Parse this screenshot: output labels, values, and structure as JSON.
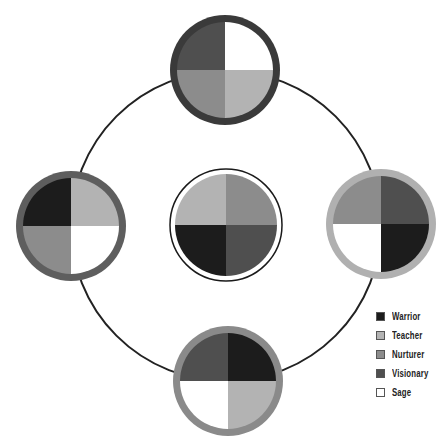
{
  "colors": {
    "Warrior": "#1c1c1c",
    "Teacher": "#b3b3b3",
    "Nurturer": "#8c8c8c",
    "Visionary": "#4f4f4f",
    "Sage": "#ffffff"
  },
  "orbit": {
    "cx": 226,
    "cy": 226,
    "r": 155,
    "stroke": "#222222"
  },
  "nodes": [
    {
      "name": "top",
      "cx": 225,
      "cy": 70,
      "r": 55,
      "ring": "#3a3a3a",
      "ring_width": 7,
      "quadrants": {
        "tl": "Visionary",
        "tr": "Sage",
        "bl": "Nurturer",
        "br": "Teacher"
      }
    },
    {
      "name": "left",
      "cx": 71,
      "cy": 226,
      "r": 55,
      "ring": "#5e5e5e",
      "ring_width": 7,
      "quadrants": {
        "tl": "Warrior",
        "tr": "Teacher",
        "bl": "Nurturer",
        "br": "Sage"
      }
    },
    {
      "name": "center",
      "cx": 226,
      "cy": 225,
      "r": 56,
      "ring": "#ffffff",
      "ring_width": 5,
      "outline": "#1a1a1a",
      "quadrants": {
        "tl": "Teacher",
        "tr": "Nurturer",
        "bl": "Warrior",
        "br": "Visionary"
      }
    },
    {
      "name": "right",
      "cx": 381,
      "cy": 224,
      "r": 55,
      "ring": "#b0b0b0",
      "ring_width": 7,
      "quadrants": {
        "tl": "Nurturer",
        "tr": "Visionary",
        "bl": "Sage",
        "br": "Warrior"
      }
    },
    {
      "name": "bottom",
      "cx": 228,
      "cy": 381,
      "r": 55,
      "ring": "#8a8a8a",
      "ring_width": 7,
      "quadrants": {
        "tl": "Visionary",
        "tr": "Warrior",
        "bl": "Sage",
        "br": "Teacher"
      }
    }
  ],
  "legend": {
    "items": [
      {
        "label": "Warrior",
        "color": "#1c1c1c"
      },
      {
        "label": "Teacher",
        "color": "#b3b3b3"
      },
      {
        "label": "Nurturer",
        "color": "#8c8c8c"
      },
      {
        "label": "Visionary",
        "color": "#4f4f4f"
      },
      {
        "label": "Sage",
        "color": "#ffffff"
      }
    ]
  }
}
